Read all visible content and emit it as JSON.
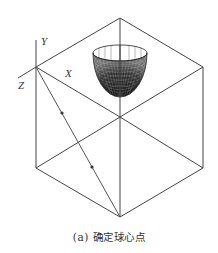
{
  "figure": {
    "caption": "(a) 确定球心点",
    "axes": {
      "y_label": "Y",
      "x_label": "X",
      "z_label": "Z"
    },
    "colors": {
      "line": "#444444",
      "mesh": "#222222",
      "background": "#ffffff"
    },
    "cube_vertices": {
      "top": [
        120,
        18
      ],
      "left_top": [
        36,
        67
      ],
      "right_top": [
        203,
        67
      ],
      "center": [
        120,
        117
      ],
      "left_bottom": [
        36,
        168
      ],
      "right_bottom": [
        203,
        168
      ],
      "bottom": [
        120,
        217
      ]
    },
    "diagonal_points": [
      [
        62,
        112
      ],
      [
        92,
        168
      ]
    ],
    "hemisphere": {
      "cx": 120,
      "cy": 53,
      "rx": 27,
      "ry": 8,
      "depth": 44
    }
  }
}
